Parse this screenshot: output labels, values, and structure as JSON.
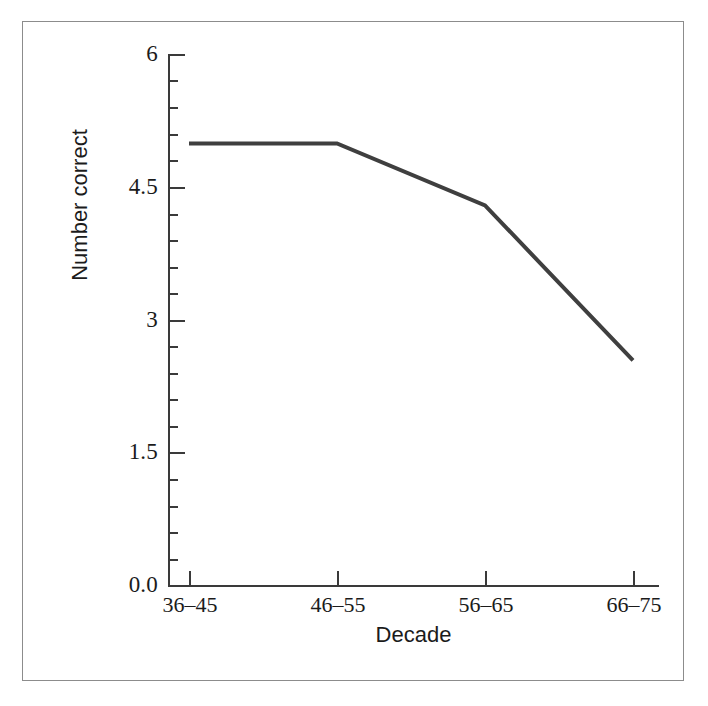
{
  "figure": {
    "background_color": "#ffffff",
    "frame_color": "#8c8c8c",
    "axis_color": "#3a3a3a",
    "line_color": "#3f3f3f"
  },
  "chart_data": {
    "type": "line",
    "title": "",
    "xlabel": "Decade",
    "ylabel": "Number correct",
    "categories": [
      "36–45",
      "46–55",
      "56–65",
      "66–75"
    ],
    "values": [
      5.0,
      5.0,
      4.3,
      2.55
    ],
    "series": [
      {
        "name": "Number correct",
        "values": [
          5.0,
          5.0,
          4.3,
          2.55
        ]
      }
    ],
    "ylim": [
      0.0,
      6.0
    ],
    "y_major_ticks": [
      0.0,
      1.5,
      3.0,
      4.5,
      6.0
    ],
    "y_major_tick_labels": [
      "0.0",
      "1.5",
      "3",
      "4.5",
      "6"
    ],
    "y_minor_tick_interval": 0.3,
    "y_minor_ticks": [
      0.3,
      0.6,
      0.9,
      1.2,
      1.8,
      2.1,
      2.4,
      2.7,
      3.3,
      3.6,
      3.9,
      4.2,
      4.8,
      5.1,
      5.4,
      5.7
    ],
    "grid": false,
    "legend": null,
    "legend_position": "none",
    "markers": false,
    "line_width_px": 4
  },
  "axes": {
    "y_title": "Number correct",
    "x_title": "Decade",
    "y_tick_labels": [
      "6",
      "4.5",
      "3",
      "1.5",
      "0.0"
    ],
    "x_tick_labels": [
      "36–45",
      "46–55",
      "56–65",
      "66–75"
    ]
  }
}
